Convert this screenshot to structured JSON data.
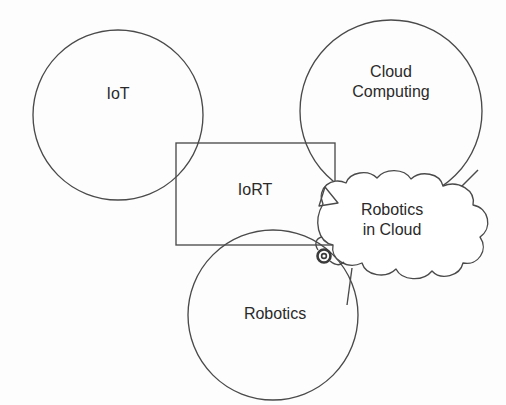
{
  "diagram": {
    "background_color": "#fdfdfd",
    "stroke_color": "#4a4a4a",
    "text_color": "#2a2a2a",
    "nodes": [
      {
        "id": "iot",
        "label": "IoT",
        "shape": "circle",
        "cx": 118,
        "cy": 115,
        "r": 85
      },
      {
        "id": "cloud_computing",
        "label": "Cloud\nComputing",
        "line1": "Cloud",
        "line2": "Computing",
        "shape": "circle",
        "cx": 391,
        "cy": 111,
        "r": 91
      },
      {
        "id": "iort",
        "label": "IoRT",
        "shape": "rectangle",
        "x": 176,
        "y": 143,
        "width": 159,
        "height": 102
      },
      {
        "id": "robotics_in_cloud",
        "label": "Robotics\nin Cloud",
        "line1": "Robotics",
        "line2": "in Cloud",
        "shape": "cloud"
      },
      {
        "id": "robotics",
        "label": "Robotics",
        "shape": "circle",
        "cx": 273,
        "cy": 315,
        "r": 85
      }
    ],
    "marks": [
      {
        "id": "knot-mark",
        "shape": "small-dark-circle",
        "cx": 324,
        "cy": 256,
        "r": 6
      }
    ]
  }
}
